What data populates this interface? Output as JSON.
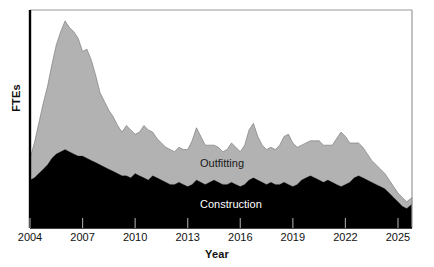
{
  "chart_data": {
    "type": "area",
    "stacked": true,
    "title": "",
    "xlabel": "Year",
    "ylabel": "FTEs",
    "grid": false,
    "legend_position": "inline-annotations",
    "xlim": [
      2004.0,
      2025.8
    ],
    "ylim": [
      0,
      100
    ],
    "xticks": [
      2004,
      2007,
      2010,
      2013,
      2016,
      2019,
      2022,
      2025
    ],
    "xtick_labels": [
      "2004",
      "2007",
      "2010",
      "2013",
      "2016",
      "2019",
      "2022",
      "2025"
    ],
    "yticks": [],
    "ytick_labels": [],
    "colors": {
      "construction": "#000000",
      "outfitting": "#b2b2b2",
      "axis": "#000000",
      "frame": "#9a9a9a",
      "label_on_dark": "#ffffff",
      "label_on_light": "#1a1a1a"
    },
    "annotations": [
      {
        "text": "Outfitting",
        "x": 2013.5,
        "y": 52,
        "color": "#1a1a1a"
      },
      {
        "text": "Construction",
        "x": 2013.5,
        "y": 20,
        "color": "#ffffff"
      }
    ],
    "x": [
      2004.0,
      2004.25,
      2004.5,
      2004.75,
      2005.0,
      2005.25,
      2005.5,
      2005.75,
      2006.0,
      2006.25,
      2006.5,
      2006.75,
      2007.0,
      2007.25,
      2007.5,
      2007.75,
      2008.0,
      2008.25,
      2008.5,
      2008.75,
      2009.0,
      2009.25,
      2009.5,
      2009.75,
      2010.0,
      2010.25,
      2010.5,
      2010.75,
      2011.0,
      2011.25,
      2011.5,
      2011.75,
      2012.0,
      2012.25,
      2012.5,
      2012.75,
      2013.0,
      2013.25,
      2013.5,
      2013.75,
      2014.0,
      2014.25,
      2014.5,
      2014.75,
      2015.0,
      2015.25,
      2015.5,
      2015.75,
      2016.0,
      2016.25,
      2016.5,
      2016.75,
      2017.0,
      2017.25,
      2017.5,
      2017.75,
      2018.0,
      2018.25,
      2018.5,
      2018.75,
      2019.0,
      2019.25,
      2019.5,
      2019.75,
      2020.0,
      2020.25,
      2020.5,
      2020.75,
      2021.0,
      2021.25,
      2021.5,
      2021.75,
      2022.0,
      2022.25,
      2022.5,
      2022.75,
      2023.0,
      2023.25,
      2023.5,
      2023.75,
      2024.0,
      2024.25,
      2024.5,
      2024.75,
      2025.0,
      2025.25,
      2025.5,
      2025.8
    ],
    "series": [
      {
        "name": "Construction",
        "color": "#000000",
        "values": [
          22,
          23,
          25,
          27,
          29,
          32,
          34,
          35,
          36,
          35,
          34,
          33,
          33,
          32,
          31,
          30,
          29,
          28,
          27,
          26,
          25,
          24,
          24,
          23,
          25,
          24,
          23,
          22,
          24,
          23,
          22,
          21,
          20,
          20,
          21,
          20,
          19,
          20,
          22,
          21,
          20,
          21,
          22,
          21,
          20,
          20,
          21,
          20,
          19,
          20,
          22,
          23,
          22,
          21,
          20,
          21,
          20,
          20,
          21,
          20,
          19,
          20,
          22,
          23,
          24,
          23,
          22,
          21,
          22,
          21,
          20,
          19,
          20,
          21,
          23,
          24,
          23,
          22,
          21,
          20,
          19,
          18,
          16,
          14,
          12,
          10,
          9,
          11
        ]
      },
      {
        "name": "Outfitting",
        "color": "#b2b2b2",
        "values": [
          10,
          16,
          23,
          30,
          36,
          43,
          50,
          55,
          59,
          57,
          56,
          54,
          48,
          50,
          46,
          40,
          33,
          30,
          27,
          25,
          22,
          20,
          23,
          22,
          18,
          20,
          24,
          23,
          20,
          18,
          17,
          16,
          16,
          15,
          16,
          16,
          17,
          20,
          24,
          21,
          18,
          17,
          16,
          16,
          15,
          16,
          18,
          17,
          16,
          18,
          23,
          25,
          20,
          17,
          16,
          16,
          16,
          18,
          21,
          23,
          20,
          17,
          16,
          16,
          16,
          17,
          18,
          17,
          16,
          17,
          21,
          25,
          22,
          18,
          16,
          15,
          14,
          12,
          10,
          9,
          8,
          7,
          6,
          5,
          4,
          4,
          3,
          3
        ]
      }
    ]
  },
  "axes": {
    "ylabel": "FTEs",
    "xlabel": "Year"
  },
  "ticks": {
    "x": [
      "2004",
      "2007",
      "2010",
      "2013",
      "2016",
      "2019",
      "2022",
      "2025"
    ]
  },
  "labels": {
    "outfitting": "Outfitting",
    "construction": "Construction"
  }
}
